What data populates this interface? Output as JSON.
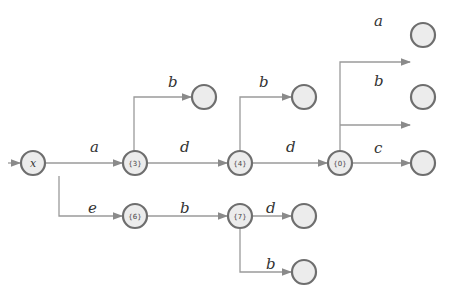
{
  "diagram": {
    "type": "trie-automaton",
    "nodes": [
      {
        "id": "root",
        "label": "x",
        "cx": 33,
        "cy": 163
      },
      {
        "id": "n3",
        "label": "{3}",
        "cx": 135,
        "cy": 163
      },
      {
        "id": "n4",
        "label": "{4}",
        "cx": 240,
        "cy": 163
      },
      {
        "id": "n0",
        "label": "{0}",
        "cx": 340,
        "cy": 163
      },
      {
        "id": "n6",
        "label": "{6}",
        "cx": 135,
        "cy": 216
      },
      {
        "id": "n7",
        "label": "{7}",
        "cx": 240,
        "cy": 216
      },
      {
        "id": "e3b",
        "label": "",
        "cx": 204,
        "cy": 97
      },
      {
        "id": "e4b",
        "label": "",
        "cx": 304,
        "cy": 97
      },
      {
        "id": "e0a",
        "label": "",
        "cx": 423,
        "cy": 62
      },
      {
        "id": "e0b",
        "label": "",
        "cx": 423,
        "cy": 125
      },
      {
        "id": "e0c",
        "label": "",
        "cx": 423,
        "cy": 163
      },
      {
        "id": "e7d",
        "label": "",
        "cx": 304,
        "cy": 216
      },
      {
        "id": "e7b",
        "label": "",
        "cx": 304,
        "cy": 272
      }
    ],
    "edges": [
      {
        "from": "start",
        "to": "root",
        "label": ""
      },
      {
        "from": "root",
        "to": "n3",
        "label": "a"
      },
      {
        "from": "n3",
        "to": "e3b",
        "label": "b"
      },
      {
        "from": "n3",
        "to": "n4",
        "label": "d"
      },
      {
        "from": "n4",
        "to": "e4b",
        "label": "b"
      },
      {
        "from": "n4",
        "to": "n0",
        "label": "d"
      },
      {
        "from": "n0",
        "to": "e0a",
        "label": "a"
      },
      {
        "from": "n0",
        "to": "e0b",
        "label": "b"
      },
      {
        "from": "n0",
        "to": "e0c",
        "label": "c"
      },
      {
        "from": "root",
        "to": "n6",
        "label": "e"
      },
      {
        "from": "n6",
        "to": "n7",
        "label": "b"
      },
      {
        "from": "n7",
        "to": "e7d",
        "label": "d"
      },
      {
        "from": "n7",
        "to": "e7b",
        "label": "b"
      }
    ]
  }
}
